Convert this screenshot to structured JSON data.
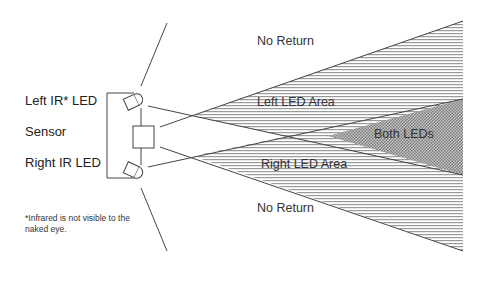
{
  "labels": {
    "left_led": "Left IR* LED",
    "sensor": "Sensor",
    "right_led": "Right IR LED",
    "footnote_line1": "*Infrared is not visible to the",
    "footnote_line2": "naked eye."
  },
  "zones": {
    "no_return_top": "No Return",
    "left_led_area": "Left LED Area",
    "both_leds": "Both LEDs",
    "right_led_area": "Right LED Area",
    "no_return_bottom": "No Return"
  },
  "colors": {
    "line": "#444444",
    "hatch": "#9a9a9a",
    "hatch_dense": "#7a7a7a",
    "background": "#ffffff"
  }
}
